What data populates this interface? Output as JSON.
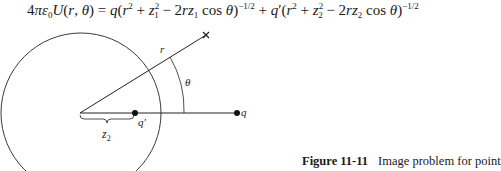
{
  "equation": {
    "lhs": "4πε₀U(r, θ)",
    "rhs": "q(r² + z₁² − 2rz₁ cos θ)^−1/2 + q′(r² + z₂² − 2rz₂ cos θ)^−1/2",
    "full_text": "4πε₀U(r, θ) = q(r² + z₁² − 2rz₁ cos θ)^(−1/2) + q′(r² + z₂² − 2rz₂ cos θ)^(−1/2)"
  },
  "figure": {
    "labels": {
      "r": "r",
      "theta": "θ",
      "q": "q",
      "q_prime": "q′",
      "z2": "z",
      "z2_sub": "2"
    }
  },
  "caption": {
    "number": "Figure 11-11",
    "text": "Image problem for point"
  }
}
